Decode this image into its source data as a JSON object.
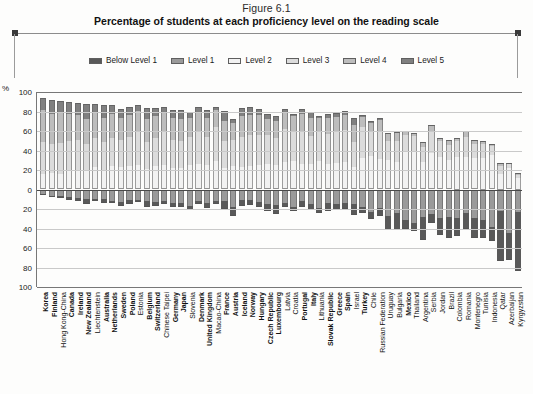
{
  "figure": {
    "number": "Figure 6.1",
    "title": "Percentage of students at each proficiency level on the reading scale"
  },
  "legend": {
    "position": "top-center",
    "items": [
      {
        "label": "Below Level 1",
        "color": "#595959"
      },
      {
        "label": "Level 1",
        "color": "#9a9a9a"
      },
      {
        "label": "Level 2",
        "color": "#f2f2f2"
      },
      {
        "label": "Level 3",
        "color": "#dcdcdc"
      },
      {
        "label": "Level 4",
        "color": "#bdbdbd"
      },
      {
        "label": "Level 5",
        "color": "#808080"
      }
    ]
  },
  "axes": {
    "y_unit": "%",
    "y_ticks": [
      "100",
      "80",
      "60",
      "40",
      "20",
      "0",
      "20",
      "40",
      "60",
      "80",
      "100"
    ],
    "y_range_above": 100,
    "y_range_below": 100,
    "zero_label": "0"
  },
  "chart_data": {
    "type": "bar",
    "subtype": "diverging-stacked-bar",
    "title": "Percentage of students at each proficiency level on the reading scale",
    "subtitle": "Figure 6.1",
    "xlabel": "",
    "ylabel": "%",
    "ylim": [
      -100,
      100
    ],
    "grid": true,
    "legend_position": "top-center",
    "note": "Bars stack upward from the zero line with Levels 2-5 (proficient) and downward with Level 1 and Below Level 1 (below baseline).",
    "series": [
      {
        "name": "Below Level 1",
        "color": "#595959",
        "direction": "down"
      },
      {
        "name": "Level 1",
        "color": "#9a9a9a",
        "direction": "down"
      },
      {
        "name": "Level 2",
        "color": "#f2f2f2",
        "direction": "up"
      },
      {
        "name": "Level 3",
        "color": "#dcdcdc",
        "direction": "up"
      },
      {
        "name": "Level 4",
        "color": "#bdbdbd",
        "direction": "up"
      },
      {
        "name": "Level 5",
        "color": "#808080",
        "direction": "up"
      }
    ],
    "categories": [
      "Korea",
      "Finland",
      "Hong Kong-China",
      "Canada",
      "Ireland",
      "New Zealand",
      "Liechtenstein",
      "Australia",
      "Netherlands",
      "Sweden",
      "Poland",
      "Estonia",
      "Belgium",
      "Switzerland",
      "Chinese Taipei",
      "Germany",
      "Japan",
      "Slovenia",
      "Denmark",
      "United Kingdom",
      "Macao-China",
      "France",
      "Austria",
      "Iceland",
      "Norway",
      "Hungary",
      "Czech Republic",
      "Luxembourg",
      "Latvia",
      "Croatia",
      "Portugal",
      "Italy",
      "Lithuania",
      "Slovak Republic",
      "Greece",
      "Spain",
      "Israel",
      "Turkey",
      "Chile",
      "Russian Federation",
      "Uruguay",
      "Bulgaria",
      "Mexico",
      "Thailand",
      "Argentina",
      "Serbia",
      "Jordan",
      "Brazil",
      "Colombia",
      "Romania",
      "Montenegro",
      "Tunisia",
      "Indonesia",
      "Qatar",
      "Azerbaijan",
      "Kyrgyzstan"
    ],
    "bold_categories": [
      "Korea",
      "Finland",
      "Canada",
      "Ireland",
      "New Zealand",
      "Australia",
      "Netherlands",
      "Sweden",
      "Poland",
      "Belgium",
      "Switzerland",
      "Germany",
      "Japan",
      "Denmark",
      "United Kingdom",
      "France",
      "Austria",
      "Iceland",
      "Norway",
      "Hungary",
      "Czech Republic",
      "Luxembourg",
      "Portugal",
      "Italy",
      "Slovak Republic",
      "Greece",
      "Spain",
      "Turkey",
      "Mexico"
    ],
    "data": [
      {
        "c": "Korea",
        "below1": 1.0,
        "l1": 4.8,
        "l2": 15.4,
        "l3": 33.0,
        "l4": 33.0,
        "l5": 12.9
      },
      {
        "c": "Finland",
        "below1": 1.5,
        "l1": 6.6,
        "l2": 16.7,
        "l3": 30.1,
        "l4": 30.6,
        "l5": 14.5
      },
      {
        "c": "Hong Kong-China",
        "below1": 2.2,
        "l1": 6.2,
        "l2": 16.1,
        "l3": 31.4,
        "l4": 31.0,
        "l5": 12.4
      },
      {
        "c": "Canada",
        "below1": 2.4,
        "l1": 8.1,
        "l2": 20.2,
        "l3": 30.0,
        "l4": 26.8,
        "l5": 12.8
      },
      {
        "c": "Ireland",
        "below1": 3.0,
        "l1": 8.3,
        "l2": 20.4,
        "l3": 30.5,
        "l4": 26.0,
        "l5": 11.7
      },
      {
        "c": "New Zealand",
        "below1": 4.8,
        "l1": 9.8,
        "l2": 19.3,
        "l3": 27.0,
        "l4": 25.8,
        "l5": 15.9
      },
      {
        "c": "Liechtenstein",
        "below1": 2.6,
        "l1": 9.6,
        "l2": 22.7,
        "l3": 30.6,
        "l4": 25.4,
        "l5": 9.0
      },
      {
        "c": "Australia",
        "below1": 4.2,
        "l1": 10.1,
        "l2": 20.4,
        "l3": 28.5,
        "l4": 24.7,
        "l5": 12.8
      },
      {
        "c": "Netherlands",
        "below1": 2.3,
        "l1": 11.6,
        "l2": 23.6,
        "l3": 29.5,
        "l4": 24.4,
        "l5": 9.4
      },
      {
        "c": "Sweden",
        "below1": 4.7,
        "l1": 12.7,
        "l2": 23.5,
        "l3": 27.7,
        "l4": 22.1,
        "l5": 9.0
      },
      {
        "c": "Poland",
        "below1": 3.8,
        "l1": 11.2,
        "l2": 24.2,
        "l3": 29.6,
        "l4": 22.3,
        "l5": 8.1
      },
      {
        "c": "Estonia",
        "below1": 2.6,
        "l1": 10.6,
        "l2": 25.6,
        "l3": 33.1,
        "l4": 21.6,
        "l5": 6.1
      },
      {
        "c": "Belgium",
        "below1": 5.9,
        "l1": 11.8,
        "l2": 21.4,
        "l3": 27.4,
        "l4": 23.9,
        "l5": 11.2
      },
      {
        "c": "Switzerland",
        "below1": 4.1,
        "l1": 12.8,
        "l2": 24.1,
        "l3": 29.2,
        "l4": 21.8,
        "l5": 8.1
      },
      {
        "c": "Chinese Taipei",
        "below1": 3.5,
        "l1": 11.9,
        "l2": 25.5,
        "l3": 33.5,
        "l4": 20.7,
        "l5": 5.2
      },
      {
        "c": "Germany",
        "below1": 4.4,
        "l1": 13.9,
        "l2": 22.2,
        "l3": 28.8,
        "l4": 22.8,
        "l5": 7.6
      },
      {
        "c": "Japan",
        "below1": 4.7,
        "l1": 13.6,
        "l2": 22.0,
        "l3": 28.0,
        "l4": 22.0,
        "l5": 9.9
      },
      {
        "c": "Slovenia",
        "below1": 4.0,
        "l1": 17.1,
        "l2": 24.9,
        "l3": 29.4,
        "l4": 19.4,
        "l5": 5.3
      },
      {
        "c": "Denmark",
        "below1": 3.3,
        "l1": 11.9,
        "l2": 26.0,
        "l3": 33.1,
        "l4": 20.5,
        "l5": 4.7
      },
      {
        "c": "United Kingdom",
        "below1": 5.1,
        "l1": 13.6,
        "l2": 24.9,
        "l3": 28.8,
        "l4": 19.9,
        "l5": 7.9
      },
      {
        "c": "Macao-China",
        "below1": 2.9,
        "l1": 12.0,
        "l2": 28.9,
        "l3": 35.0,
        "l4": 18.0,
        "l5": 2.9
      },
      {
        "c": "France",
        "below1": 7.9,
        "l1": 11.8,
        "l2": 22.2,
        "l3": 27.2,
        "l4": 21.1,
        "l5": 9.6
      },
      {
        "c": "Austria",
        "below1": 10.0,
        "l1": 17.5,
        "l2": 24.4,
        "l3": 26.0,
        "l4": 17.3,
        "l5": 4.9
      },
      {
        "c": "Iceland",
        "below1": 6.6,
        "l1": 10.4,
        "l2": 23.0,
        "l3": 30.5,
        "l4": 21.9,
        "l5": 8.5
      },
      {
        "c": "Norway",
        "below1": 4.8,
        "l1": 10.9,
        "l2": 24.4,
        "l3": 31.5,
        "l4": 20.7,
        "l5": 8.4
      },
      {
        "c": "Hungary",
        "below1": 4.8,
        "l1": 12.7,
        "l2": 24.6,
        "l3": 31.5,
        "l4": 20.3,
        "l5": 6.1
      },
      {
        "c": "Czech Republic",
        "below1": 7.1,
        "l1": 15.2,
        "l2": 26.2,
        "l3": 29.4,
        "l4": 17.0,
        "l5": 5.1
      },
      {
        "c": "Luxembourg",
        "below1": 9.2,
        "l1": 16.4,
        "l2": 25.3,
        "l3": 27.4,
        "l4": 17.2,
        "l5": 5.0
      },
      {
        "c": "Latvia",
        "below1": 4.0,
        "l1": 13.5,
        "l2": 28.6,
        "l3": 33.1,
        "l4": 17.5,
        "l5": 2.9
      },
      {
        "c": "Croatia",
        "below1": 4.8,
        "l1": 17.6,
        "l2": 29.1,
        "l3": 31.4,
        "l4": 14.4,
        "l5": 3.0
      },
      {
        "c": "Portugal",
        "below1": 5.6,
        "l1": 12.0,
        "l2": 26.4,
        "l3": 32.9,
        "l4": 18.6,
        "l5": 4.8
      },
      {
        "c": "Italy",
        "below1": 5.9,
        "l1": 15.1,
        "l2": 25.8,
        "l3": 29.5,
        "l4": 18.4,
        "l5": 5.8
      },
      {
        "c": "Lithuania",
        "below1": 5.8,
        "l1": 18.5,
        "l2": 29.6,
        "l3": 30.1,
        "l4": 13.5,
        "l5": 2.5
      },
      {
        "c": "Slovak Republic",
        "below1": 8.0,
        "l1": 14.3,
        "l2": 26.2,
        "l3": 30.6,
        "l4": 16.6,
        "l5": 4.2
      },
      {
        "c": "Greece",
        "below1": 6.6,
        "l1": 14.7,
        "l2": 27.5,
        "l3": 31.0,
        "l4": 16.3,
        "l5": 4.1
      },
      {
        "c": "Spain",
        "below1": 5.3,
        "l1": 14.3,
        "l2": 28.4,
        "l3": 33.1,
        "l4": 15.4,
        "l5": 3.5
      },
      {
        "c": "Israel",
        "below1": 12.1,
        "l1": 14.5,
        "l2": 23.0,
        "l3": 26.0,
        "l4": 17.5,
        "l5": 6.8
      },
      {
        "c": "Turkey",
        "below1": 5.6,
        "l1": 18.1,
        "l2": 32.2,
        "l3": 31.5,
        "l4": 11.1,
        "l5": 1.8
      },
      {
        "c": "Chile",
        "below1": 7.4,
        "l1": 23.2,
        "l2": 34.0,
        "l3": 26.5,
        "l4": 8.0,
        "l5": 1.3
      },
      {
        "c": "Russian Federation",
        "below1": 8.1,
        "l1": 19.1,
        "l2": 31.3,
        "l3": 28.2,
        "l4": 11.5,
        "l5": 1.9
      },
      {
        "c": "Uruguay",
        "below1": 14.6,
        "l1": 27.3,
        "l2": 29.8,
        "l3": 20.3,
        "l4": 6.7,
        "l5": 1.4
      },
      {
        "c": "Bulgaria",
        "below1": 17.4,
        "l1": 23.8,
        "l2": 28.5,
        "l3": 21.6,
        "l4": 7.4,
        "l5": 1.4
      },
      {
        "c": "Mexico",
        "below1": 8.6,
        "l1": 31.6,
        "l2": 38.5,
        "l3": 18.6,
        "l4": 2.6,
        "l5": 0.2
      },
      {
        "c": "Thailand",
        "below1": 8.4,
        "l1": 34.0,
        "l2": 38.7,
        "l3": 16.6,
        "l4": 2.2,
        "l5": 0.2
      },
      {
        "c": "Argentina",
        "below1": 22.9,
        "l1": 28.5,
        "l2": 28.6,
        "l3": 15.6,
        "l4": 4.1,
        "l5": 0.4
      },
      {
        "c": "Serbia",
        "below1": 9.0,
        "l1": 24.9,
        "l2": 37.8,
        "l3": 23.1,
        "l4": 4.9,
        "l5": 0.4
      },
      {
        "c": "Jordan",
        "below1": 17.4,
        "l1": 29.5,
        "l2": 33.5,
        "l3": 16.6,
        "l4": 2.9,
        "l5": 0.2
      },
      {
        "c": "Brazil",
        "below1": 21.1,
        "l1": 28.5,
        "l2": 31.1,
        "l3": 15.6,
        "l4": 3.4,
        "l5": 0.4
      },
      {
        "c": "Colombia",
        "below1": 17.8,
        "l1": 29.6,
        "l2": 34.4,
        "l3": 15.8,
        "l4": 2.3,
        "l5": 0.1
      },
      {
        "c": "Romania",
        "below1": 16.0,
        "l1": 24.4,
        "l2": 34.0,
        "l3": 20.9,
        "l4": 4.3,
        "l5": 0.4
      },
      {
        "c": "Montenegro",
        "below1": 19.8,
        "l1": 29.7,
        "l2": 32.3,
        "l3": 15.3,
        "l4": 2.7,
        "l5": 0.2
      },
      {
        "c": "Tunisia",
        "below1": 19.0,
        "l1": 31.0,
        "l2": 33.2,
        "l3": 14.1,
        "l4": 2.5,
        "l5": 0.2
      },
      {
        "c": "Indonesia",
        "below1": 15.1,
        "l1": 38.0,
        "l2": 36.0,
        "l3": 10.1,
        "l4": 0.8,
        "l5": 0.0
      },
      {
        "c": "Qatar",
        "below1": 51.5,
        "l1": 21.7,
        "l2": 16.6,
        "l3": 7.9,
        "l4": 2.0,
        "l5": 0.3
      },
      {
        "c": "Azerbaijan",
        "below1": 27.6,
        "l1": 45.1,
        "l2": 23.2,
        "l3": 3.8,
        "l4": 0.3,
        "l5": 0.0
      },
      {
        "c": "Kyrgyzstan",
        "below1": 59.9,
        "l1": 23.3,
        "l2": 12.4,
        "l3": 3.8,
        "l4": 0.6,
        "l5": 0.0
      }
    ]
  }
}
